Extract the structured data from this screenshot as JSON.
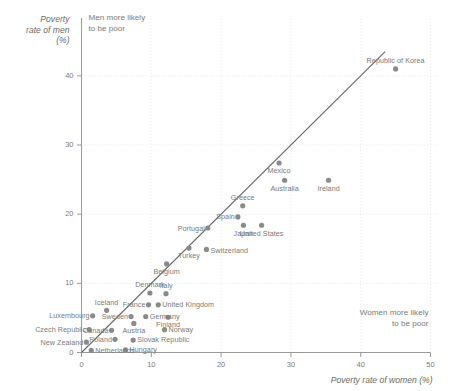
{
  "chart_data": {
    "type": "scatter",
    "title": "",
    "xlabel": "Poverty rate of women (%)",
    "ylabel": "Poverty rate of men (%)",
    "ylabel_lines": [
      "Poverty",
      "rate of men",
      "(%)"
    ],
    "xlim": [
      0,
      50
    ],
    "ylim": [
      0,
      42
    ],
    "xticks": [
      "0",
      "10",
      "20",
      "30",
      "40",
      "50"
    ],
    "xtick_values": [
      0,
      10,
      20,
      30,
      40,
      50
    ],
    "yticks": [
      "0",
      "10",
      "20",
      "30",
      "40"
    ],
    "ytick_values": [
      0,
      10,
      20,
      30,
      40
    ],
    "grid": true,
    "legend": "none",
    "reference_line": {
      "label": "45-degree equality line",
      "from": [
        0,
        0
      ],
      "to": [
        43.5,
        43.5
      ]
    },
    "annotations": [
      {
        "name": "men-more-likely",
        "text": "Men more likely\nto be poor",
        "line1": "Men more likely",
        "line2": "to be poor"
      },
      {
        "name": "women-more-likely",
        "text": "Women more likely\nto be poor",
        "line1": "Women more likely",
        "line2": "to be poor"
      }
    ],
    "point_color": "#8a8a8a",
    "line_color": "#6a6a6a",
    "axis_color": "#9a9a9a",
    "grid_color": "#e2e2e2",
    "points": [
      {
        "label": "New Zealand",
        "x": 0.7,
        "y": 1.5,
        "lx": -3,
        "ly": 0,
        "anchor": "end"
      },
      {
        "label": "Czech Republic",
        "x": 1.1,
        "y": 3.3,
        "lx": -3,
        "ly": 0,
        "anchor": "end"
      },
      {
        "label": "Luxembourg",
        "x": 1.6,
        "y": 5.3,
        "lx": -3,
        "ly": 0,
        "anchor": "end"
      },
      {
        "label": "Netherlands",
        "x": 1.4,
        "y": 0.3,
        "lx": 4,
        "ly": 0,
        "anchor": "start"
      },
      {
        "label": "Iceland",
        "x": 3.6,
        "y": 6.1,
        "lx": 0,
        "ly": -8,
        "anchor": "middle"
      },
      {
        "label": "Canada",
        "x": 4.3,
        "y": 3.2,
        "lx": -3,
        "ly": 0,
        "anchor": "end"
      },
      {
        "label": "Poland",
        "x": 4.8,
        "y": 1.9,
        "lx": -3,
        "ly": 0,
        "anchor": "end"
      },
      {
        "label": "Hungary",
        "x": 6.3,
        "y": 0.4,
        "lx": 4,
        "ly": 0,
        "anchor": "start"
      },
      {
        "label": "Sweden",
        "x": 7.1,
        "y": 5.2,
        "lx": -3,
        "ly": 0,
        "anchor": "end"
      },
      {
        "label": "Austria",
        "x": 7.5,
        "y": 4.2,
        "lx": 0,
        "ly": 7.5,
        "anchor": "middle"
      },
      {
        "label": "Slovak Republic",
        "x": 7.4,
        "y": 1.8,
        "lx": 4,
        "ly": 0,
        "anchor": "start"
      },
      {
        "label": "Germany",
        "x": 9.2,
        "y": 5.2,
        "lx": 4,
        "ly": 0,
        "anchor": "start"
      },
      {
        "label": "France",
        "x": 9.6,
        "y": 6.9,
        "lx": -3,
        "ly": 0,
        "anchor": "end"
      },
      {
        "label": "Denmark",
        "x": 9.8,
        "y": 8.6,
        "lx": 0,
        "ly": -8,
        "anchor": "middle"
      },
      {
        "label": "United Kingdom",
        "x": 11.0,
        "y": 6.9,
        "lx": 4,
        "ly": 0,
        "anchor": "start"
      },
      {
        "label": "Italy",
        "x": 12.1,
        "y": 8.5,
        "lx": 0,
        "ly": -8,
        "anchor": "middle"
      },
      {
        "label": "Norway",
        "x": 11.9,
        "y": 3.3,
        "lx": 4,
        "ly": 0,
        "anchor": "start"
      },
      {
        "label": "Finland",
        "x": 12.4,
        "y": 5.1,
        "lx": 0,
        "ly": 7.5,
        "anchor": "middle"
      },
      {
        "label": "Belgium",
        "x": 12.2,
        "y": 12.8,
        "lx": 0,
        "ly": 8,
        "anchor": "middle"
      },
      {
        "label": "Turkey",
        "x": 15.4,
        "y": 15.1,
        "lx": 0,
        "ly": 8,
        "anchor": "middle"
      },
      {
        "label": "Switzerland",
        "x": 17.9,
        "y": 14.9,
        "lx": 4,
        "ly": 1,
        "anchor": "start"
      },
      {
        "label": "Portugal",
        "x": 18.1,
        "y": 18.0,
        "lx": -3,
        "ly": 1,
        "anchor": "end"
      },
      {
        "label": "Spain",
        "x": 22.4,
        "y": 19.6,
        "lx": -3,
        "ly": 0,
        "anchor": "end"
      },
      {
        "label": "Greece",
        "x": 23.1,
        "y": 21.2,
        "lx": 0,
        "ly": -8,
        "anchor": "middle"
      },
      {
        "label": "Japan",
        "x": 23.2,
        "y": 18.4,
        "lx": 0,
        "ly": 8,
        "anchor": "middle"
      },
      {
        "label": "United States",
        "x": 25.8,
        "y": 18.4,
        "lx": 0,
        "ly": 8,
        "anchor": "middle"
      },
      {
        "label": "Mexico",
        "x": 28.3,
        "y": 27.4,
        "lx": 0,
        "ly": 8,
        "anchor": "middle"
      },
      {
        "label": "Australia",
        "x": 29.1,
        "y": 24.9,
        "lx": 0,
        "ly": 8,
        "anchor": "middle"
      },
      {
        "label": "Ireland",
        "x": 35.4,
        "y": 24.9,
        "lx": 0,
        "ly": 8,
        "anchor": "middle"
      },
      {
        "label": "Republic of Korea",
        "x": 45.0,
        "y": 41.0,
        "lx": 0,
        "ly": -8,
        "anchor": "middle"
      }
    ]
  }
}
